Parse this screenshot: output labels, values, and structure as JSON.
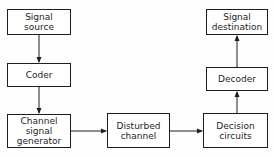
{
  "diagram": {
    "type": "block-diagram",
    "colors": {
      "stroke": "#1e1e1e",
      "background": "#ffffff"
    },
    "nodes": [
      {
        "id": "signal_source",
        "label": "Signal\nsource"
      },
      {
        "id": "coder",
        "label": "Coder"
      },
      {
        "id": "channel_signal_generator",
        "label": "Channel\nsignal\ngenerator"
      },
      {
        "id": "disturbed_channel",
        "label": "Disturbed\nchannel"
      },
      {
        "id": "decision_circuits",
        "label": "Decision\ncircuits"
      },
      {
        "id": "decoder",
        "label": "Decoder"
      },
      {
        "id": "signal_destination",
        "label": "Signal\ndestination"
      }
    ],
    "edges": [
      {
        "from": "signal_source",
        "to": "coder"
      },
      {
        "from": "coder",
        "to": "channel_signal_generator"
      },
      {
        "from": "channel_signal_generator",
        "to": "disturbed_channel"
      },
      {
        "from": "disturbed_channel",
        "to": "decision_circuits"
      },
      {
        "from": "decision_circuits",
        "to": "decoder"
      },
      {
        "from": "decoder",
        "to": "signal_destination"
      }
    ]
  }
}
